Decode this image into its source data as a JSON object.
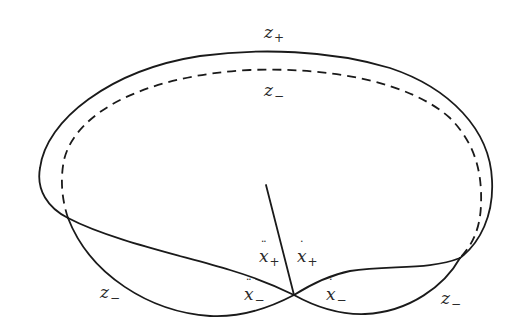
{
  "diagram": {
    "type": "phase-curve-sketch",
    "curves": {
      "outer_solid": "closed outer loop (solid)",
      "inner_dashed": "inner loop (dashed)",
      "left_lobe": "lower-left lobe (solid)",
      "right_lobe": "lower-right lobe (solid)",
      "spoke": "radial line from interior to crossing point"
    },
    "labels": {
      "top_outer": {
        "base": "z",
        "sub": "+"
      },
      "top_inner": {
        "base": "z",
        "sub": "−"
      },
      "bottom_left": {
        "base": "z",
        "sub": "−"
      },
      "bottom_right": {
        "base": "z",
        "sub": "−"
      },
      "xddot_plus": {
        "base": "x",
        "accent": "double-dot",
        "sub": "+"
      },
      "xdot_plus": {
        "base": "x",
        "accent": "dot",
        "sub": "+"
      },
      "xddot_minus": {
        "base": "x",
        "accent": "double-dot",
        "sub": "−"
      },
      "xdot_minus": {
        "base": "x",
        "accent": "dot",
        "sub": "−"
      }
    },
    "colors": {
      "stroke": "#1a1a1a",
      "text": "#2a2a2a",
      "background": "#ffffff"
    }
  }
}
